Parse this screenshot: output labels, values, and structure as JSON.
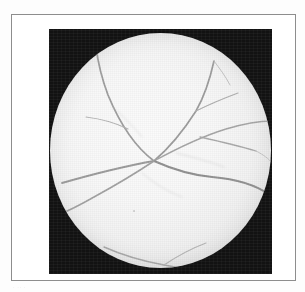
{
  "page": {
    "background_color": "#fdfdfd",
    "width": 305,
    "height": 292
  },
  "figure": {
    "frame_border_color": "#8d8d8d",
    "plate_background_color": "#121212",
    "caption_artifact_text": "· ·· ·",
    "image_kind": "retinal-fundus-photograph",
    "modality": "grayscale fundus photograph",
    "field_shape": "circle"
  },
  "fundus": {
    "field_center_x": 111,
    "field_center_y": 122,
    "field_radius_x": 110,
    "field_radius_y": 117,
    "background_tone": "#f8f8f8",
    "vessel_color": "#9a9a9a",
    "vessel_color_dark": "#808080",
    "vessel_color_faint": "#b8b8b8",
    "optic_disc_visible": false,
    "bifurcation_x": 104,
    "bifurcation_y": 128,
    "vessel_count_major": 6
  },
  "vessels": {
    "main_trunk": "M 12 150 C 40 142, 70 134, 104 128",
    "branch_upper_left": "M 104 128 C 88 116, 72 96, 58 62 C 52 46, 48 30, 46 14",
    "branch_upper_left_spur": "M 78 96 C 66 90, 52 86, 36 84",
    "branch_superior_arcade": "M 104 128 C 118 116, 132 100, 146 78 C 154 64, 160 46, 164 28",
    "branch_superior_fork": "M 146 78 C 158 72, 172 66, 188 60",
    "branch_temporal_upper": "M 104 128 C 126 116, 150 104, 176 96 C 196 90, 212 88, 222 88",
    "branch_temporal_upper_b": "M 150 104 C 168 108, 186 112, 206 118",
    "branch_inferior": "M 104 128 C 122 136, 140 142, 162 144 C 186 146, 206 152, 220 162",
    "branch_inferior_low": "M 104 128 C 86 140, 66 152, 44 164 C 30 172, 18 178, 8 182",
    "branch_inferior_arcade": "M 54 214 C 72 222, 92 228, 114 232 C 134 236, 152 238, 168 238",
    "branch_inferior_arcade_spur": "M 114 232 C 126 224, 140 216, 156 210",
    "branch_far_right_thin": "M 206 118 C 214 122, 219 126, 222 130",
    "branch_thin_upper": "M 164 28 C 170 36, 176 44, 180 52"
  }
}
